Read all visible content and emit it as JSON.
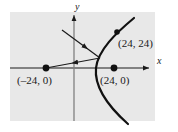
{
  "figure": {
    "background_color": "#ffffff",
    "panel_color": "#e8e8e8",
    "ink_color": "#1a1a1a",
    "axis_labels": {
      "x": "x",
      "y": "y"
    },
    "points": [
      {
        "id": "focus-left",
        "label": "(–24, 0)",
        "x": 46,
        "y": 68
      },
      {
        "id": "focus-right",
        "label": "(24, 0)",
        "x": 114,
        "y": 68
      },
      {
        "id": "curve-point",
        "label": "(24, 24)",
        "x": 117,
        "y": 32
      }
    ],
    "label_positions": {
      "left_point_label": {
        "x": 17,
        "y": 84
      },
      "right_point_label": {
        "x": 100,
        "y": 84
      },
      "curve_point_label": {
        "x": 118,
        "y": 47
      },
      "x_axis_label": {
        "x": 158,
        "y": 64
      },
      "y_axis_label": {
        "x": 77,
        "y": 10
      }
    },
    "curve": {
      "type": "parabola-opening-right",
      "vertex": {
        "x": 96,
        "y": 68
      },
      "path": "M 134 18 C 116 33, 98 50, 96 68 C 94 88, 110 108, 128 124"
    },
    "rays": [
      {
        "id": "incoming-ray",
        "from": {
          "x": 62,
          "y": 30
        },
        "to": {
          "x": 100,
          "y": 58
        },
        "arrow_direction": "down-right",
        "arrow_at": {
          "x": 84,
          "y": 46
        }
      },
      {
        "id": "reflected-ray",
        "from": {
          "x": 100,
          "y": 58
        },
        "to": {
          "x": 46,
          "y": 68
        },
        "arrow_direction": "left",
        "arrow_at": {
          "x": 74,
          "y": 63
        }
      }
    ],
    "axes": {
      "x_axis": {
        "x1": 10,
        "y1": 68,
        "x2": 152,
        "y2": 68,
        "arrow": "right"
      },
      "y_axis": {
        "x1": 74,
        "y1": 12,
        "x2": 74,
        "y2": 121,
        "arrow": "up"
      }
    }
  }
}
